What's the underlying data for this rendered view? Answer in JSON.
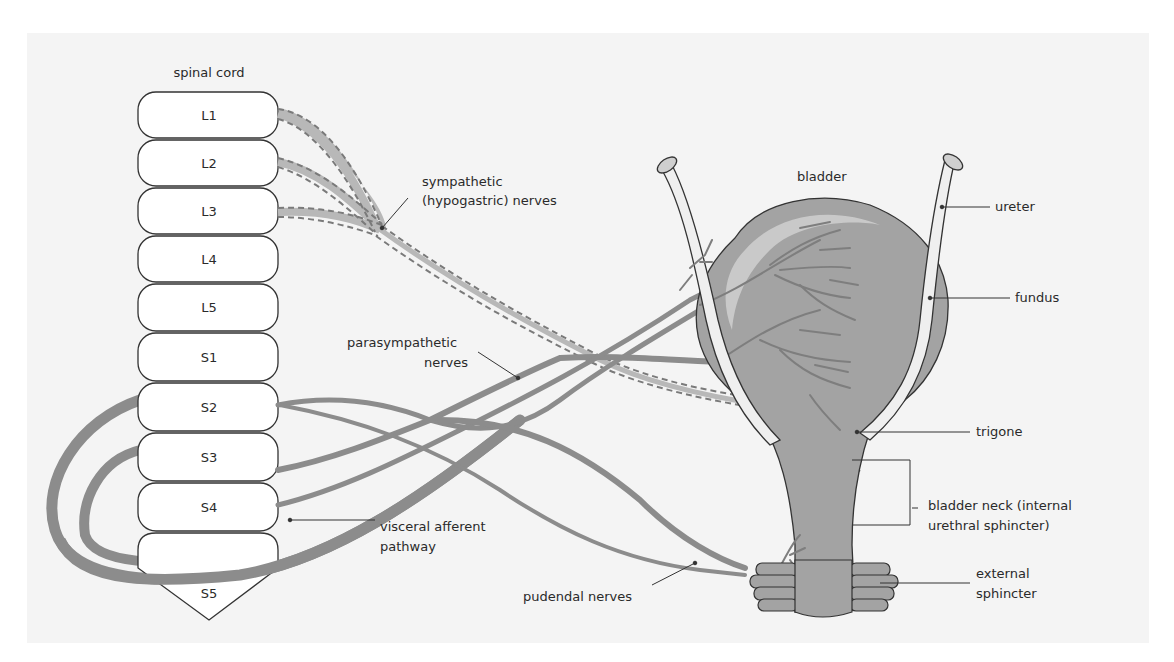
{
  "figure": {
    "colors": {
      "background": "#f4f4f4",
      "nerve": "#8c8c8c",
      "sympathetic_fill": "#b8b8b8",
      "bladder": "#a3a3a3",
      "bladder_highlight": "#c9c9c9",
      "ureter": "#efefef",
      "outline": "#333333",
      "text": "#2a2a2a"
    }
  },
  "spinal_cord": {
    "title": "spinal cord",
    "segments": [
      {
        "id": "L1",
        "label": "L1"
      },
      {
        "id": "L2",
        "label": "L2"
      },
      {
        "id": "L3",
        "label": "L3"
      },
      {
        "id": "L4",
        "label": "L4"
      },
      {
        "id": "L5",
        "label": "L5"
      },
      {
        "id": "S1",
        "label": "S1"
      },
      {
        "id": "S2",
        "label": "S2"
      },
      {
        "id": "S3",
        "label": "S3"
      },
      {
        "id": "S4",
        "label": "S4"
      },
      {
        "id": "S5",
        "label": "S5"
      }
    ]
  },
  "labels": {
    "bladder": "bladder",
    "sympathetic_line1": "sympathetic",
    "sympathetic_line2": "(hypogastric) nerves",
    "parasympathetic_line1": "parasympathetic",
    "parasympathetic_line2": "nerves",
    "visceral_line1": "visceral afferent",
    "visceral_line2": "pathway",
    "pudendal": "pudendal nerves",
    "ureter": "ureter",
    "fundus": "fundus",
    "trigone": "trigone",
    "bladder_neck_line1": "bladder neck (internal",
    "bladder_neck_line2": "urethral sphincter)",
    "external_line1": "external",
    "external_line2": "sphincter"
  }
}
